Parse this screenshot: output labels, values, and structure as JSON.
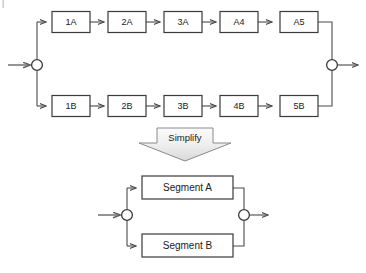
{
  "diagram": {
    "type": "reliability-block-diagram",
    "colors": {
      "box_stroke": "#3a3a3a",
      "box_fill": "#ffffff",
      "edge": "#4a4a4a",
      "node_stroke": "#3a3a3a",
      "arrow_fill_top": "#fbfbfb",
      "arrow_fill_bottom": "#dcdcdc",
      "arrow_stroke": "#8a8a8a",
      "text": "#1a1a1a",
      "background": "#ffffff"
    },
    "top": {
      "branch_a": {
        "name": "Branch A",
        "blocks": [
          {
            "label": "1A"
          },
          {
            "label": "2A"
          },
          {
            "label": "3A"
          },
          {
            "label": "A4"
          },
          {
            "label": "A5"
          }
        ]
      },
      "branch_b": {
        "name": "Branch B",
        "blocks": [
          {
            "label": "1B"
          },
          {
            "label": "2B"
          },
          {
            "label": "3B"
          },
          {
            "label": "4B"
          },
          {
            "label": "5B"
          }
        ]
      },
      "input_node": {
        "name": "input-junction"
      },
      "output_node": {
        "name": "output-junction"
      }
    },
    "transform": {
      "label": "Simplify",
      "direction": "down"
    },
    "bottom": {
      "blocks": [
        {
          "label": "Segment A"
        },
        {
          "label": "Segment B"
        }
      ],
      "input_node": {
        "name": "input-junction"
      },
      "output_node": {
        "name": "output-junction"
      }
    }
  }
}
